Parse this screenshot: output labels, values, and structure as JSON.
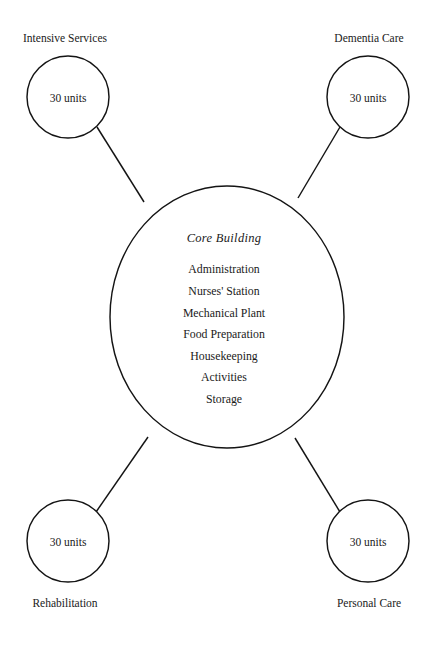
{
  "diagram": {
    "type": "hub-and-spoke facility layout",
    "stroke_color": "#141414",
    "background_color": "#ffffff",
    "core": {
      "title": "Core Building",
      "items": [
        "Administration",
        "Nurses' Station",
        "Mechanical Plant",
        "Food Preparation",
        "Housekeeping",
        "Activities",
        "Storage"
      ],
      "center": {
        "x": 227,
        "y": 317
      },
      "radius_x": 117,
      "radius_y": 131
    },
    "satellites": [
      {
        "label": "Intensive Services",
        "units": "30 units",
        "position": "top-left",
        "center": {
          "x": 68,
          "y": 97
        },
        "radius": 41,
        "label_point": {
          "x": 65,
          "y": 38
        }
      },
      {
        "label": "Dementia Care",
        "units": "30 units",
        "position": "top-right",
        "center": {
          "x": 368,
          "y": 97
        },
        "radius": 41,
        "label_point": {
          "x": 369,
          "y": 38
        }
      },
      {
        "label": "Rehabilitation",
        "units": "30 units",
        "position": "bottom-left",
        "center": {
          "x": 68,
          "y": 541
        },
        "radius": 41,
        "label_point": {
          "x": 65,
          "y": 603
        }
      },
      {
        "label": "Personal Care",
        "units": "30 units",
        "position": "bottom-right",
        "center": {
          "x": 368,
          "y": 541
        },
        "radius": 41,
        "label_point": {
          "x": 369,
          "y": 603
        }
      }
    ]
  }
}
